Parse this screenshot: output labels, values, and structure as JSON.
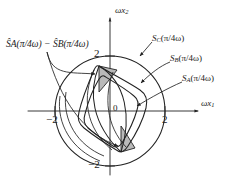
{
  "figure": {
    "type": "phase-plane-diagram",
    "background": "#ffffff",
    "stroke_color": "#222222",
    "shade_color": "#b9b9b9",
    "axes": {
      "x_label": "ωx",
      "x_label_sub": "1",
      "y_label": "ωx",
      "y_label_sub": "2",
      "origin_label": "0",
      "x_ticks": [
        {
          "value": "-2",
          "text": "−2"
        },
        {
          "value": "2",
          "text": "2"
        }
      ],
      "y_ticks": [
        {
          "value": "2",
          "text": "2"
        },
        {
          "value": "-2",
          "text": "−2"
        }
      ],
      "x_range": [
        -2.9,
        2.9
      ],
      "y_range": [
        -2.6,
        2.6
      ]
    },
    "labels": {
      "difference": {
        "hat_a": "S",
        "sub_a": "A",
        "arg_a": "(π/4ω)",
        "minus": "−",
        "hat_b": "S",
        "sub_b": "B",
        "arg_b": "(π/4ω)",
        "full_text": "ŜA(π/4ω) − ŜB(π/4ω)"
      },
      "set_c": {
        "name": "S",
        "sub": "C",
        "arg": "(π/4ω)"
      },
      "set_b": {
        "name": "S",
        "sub": "B",
        "arg": "(π/4ω)"
      },
      "set_a": {
        "name": "S",
        "sub": "A",
        "arg": "(π/4ω)"
      }
    },
    "regions": {
      "circle_radius": 2.0,
      "shaded_slivers": 2
    }
  }
}
